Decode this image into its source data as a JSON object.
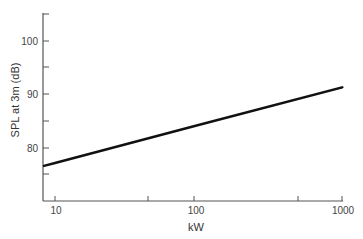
{
  "chart_data": {
    "type": "line",
    "title": "",
    "xlabel": "kW",
    "ylabel": "SPL at 3m (dB)",
    "xscale": "log",
    "xlim": [
      8,
      1050
    ],
    "ylim": [
      70,
      105
    ],
    "x_ticks": [
      10,
      50,
      100,
      500,
      1000
    ],
    "x_tick_labels": [
      "10",
      "",
      "100",
      "",
      "1000"
    ],
    "y_ticks": [
      75,
      80,
      85,
      90,
      95,
      100
    ],
    "y_tick_labels": [
      "",
      "80",
      "",
      "90",
      "",
      "100"
    ],
    "grid": false,
    "legend": null,
    "series": [
      {
        "name": "SPL",
        "x": [
          8,
          10,
          100,
          1000,
          1050
        ],
        "values": [
          76.6,
          77.2,
          84.3,
          91.3,
          91.5
        ]
      }
    ]
  },
  "labels": {
    "ylabel": "SPL at 3m (dB)",
    "xlabel": "kW",
    "y100": "100",
    "y90": "90",
    "y80": "80",
    "x10": "10",
    "x100": "100",
    "x1000": "1000"
  }
}
